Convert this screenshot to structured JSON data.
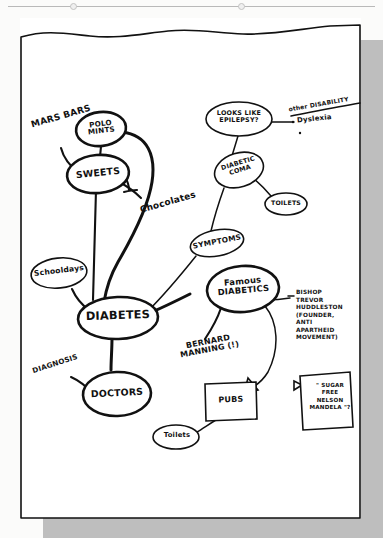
{
  "page": {
    "kind": "hand-drawn mind map on white paper",
    "ink_color": "#111111",
    "paper_color": "#ffffff",
    "background_color": "#fbfbfa"
  },
  "central_topic": {
    "label": "DIABETES"
  },
  "nodes": [
    {
      "id": "mars-bars",
      "label": "MARS BARS",
      "shape": "plain-text",
      "rotation": -16
    },
    {
      "id": "polo-mints",
      "label": "POLO\nMINTS",
      "shape": "ellipse"
    },
    {
      "id": "sweets",
      "label": "SWEETS",
      "shape": "ellipse"
    },
    {
      "id": "chocolates",
      "label": "Chocolates",
      "shape": "plain-text",
      "rotation": -16
    },
    {
      "id": "schooldays",
      "label": "Schooldays",
      "shape": "ellipse"
    },
    {
      "id": "diabetes",
      "label": "DIABETES",
      "shape": "ellipse"
    },
    {
      "id": "doctors",
      "label": "DOCTORS",
      "shape": "ellipse"
    },
    {
      "id": "diagnosis",
      "label": "DIAGNOSIS",
      "shape": "plain-text",
      "rotation": -18
    },
    {
      "id": "symptoms",
      "label": "SYMPTOMS",
      "shape": "ellipse"
    },
    {
      "id": "diabetic-coma",
      "label": "DIABETIC\nCOMA",
      "shape": "ellipse"
    },
    {
      "id": "looks-like-epilepsy",
      "label": "LOOKS LIKE\nEPILEPSY?",
      "shape": "ellipse"
    },
    {
      "id": "toilets-coma",
      "label": "TOILETS",
      "shape": "ellipse"
    },
    {
      "id": "famous-diabetics",
      "label": "Famous\nDIABETICS",
      "shape": "ellipse"
    },
    {
      "id": "bernard-manning",
      "label": "BERNARD\nMANNING (!)",
      "shape": "plain-text",
      "rotation": -12
    },
    {
      "id": "pubs",
      "label": "PUBS",
      "shape": "rectangle"
    },
    {
      "id": "toilets-pubs",
      "label": "Toilets",
      "shape": "ellipse"
    }
  ],
  "annotations": [
    {
      "id": "other-disability",
      "label": "other DISABILITY",
      "style": "underlined",
      "rotation": -10
    },
    {
      "id": "dyslexia",
      "label": "Dyslexia",
      "style": "bulleted",
      "rotation": -6
    },
    {
      "id": "huddleston-note",
      "label": "BISHOP\nTREVOR\nHUDDLESTON\n(FOUNDER,\n   ANTI\nAPARTHEID\n MOVEMENT)"
    }
  ],
  "sticky_note": {
    "id": "sugar-free-mandela-note",
    "label": "\" SUGAR\n   FREE\n NELSON\nMANDELA \"?",
    "shape": "square-note-with-arrow"
  },
  "connections": [
    {
      "from": "mars-bars",
      "to": "sweets"
    },
    {
      "from": "polo-mints",
      "to": "sweets"
    },
    {
      "from": "polo-mints",
      "to": "diabetes",
      "style": "long-curve"
    },
    {
      "from": "sweets",
      "to": "chocolates"
    },
    {
      "from": "sweets",
      "to": "diabetes"
    },
    {
      "from": "schooldays",
      "to": "diabetes"
    },
    {
      "from": "diabetes",
      "to": "doctors"
    },
    {
      "from": "diagnosis",
      "to": "doctors"
    },
    {
      "from": "diabetes",
      "to": "symptoms"
    },
    {
      "from": "symptoms",
      "to": "diabetic-coma"
    },
    {
      "from": "diabetic-coma",
      "to": "looks-like-epilepsy"
    },
    {
      "from": "diabetic-coma",
      "to": "toilets-coma"
    },
    {
      "from": "looks-like-epilepsy",
      "to": "dyslexia"
    },
    {
      "from": "diabetes",
      "to": "famous-diabetics"
    },
    {
      "from": "famous-diabetics",
      "to": "bernard-manning"
    },
    {
      "from": "famous-diabetics",
      "to": "huddleston-note"
    },
    {
      "from": "famous-diabetics",
      "to": "pubs",
      "style": "arrow"
    },
    {
      "from": "pubs",
      "to": "toilets-pubs"
    },
    {
      "from": "huddleston-note",
      "to": "sugar-free-mandela-note",
      "style": "arrow"
    }
  ]
}
